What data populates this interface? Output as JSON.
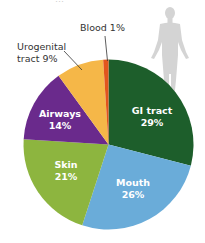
{
  "chart_data": {
    "type": "pie",
    "title": "",
    "categories": [
      "GI tract",
      "Mouth",
      "Skin",
      "Airways",
      "Urogenital tract",
      "Blood"
    ],
    "values": [
      29,
      26,
      21,
      14,
      9,
      1
    ],
    "unit": "%",
    "colors": [
      "#1d5e2b",
      "#6aacd9",
      "#8db53f",
      "#6a2a8c",
      "#f5b748",
      "#e2551d"
    ],
    "start_angle": "top, clockwise",
    "labels": {
      "gi": {
        "name": "GI tract",
        "pct": "29%"
      },
      "mouth": {
        "name": "Mouth",
        "pct": "26%"
      },
      "skin": {
        "name": "Skin",
        "pct": "21%"
      },
      "airways": {
        "name": "Airways",
        "pct": "14%"
      },
      "urogenital": {
        "line1": "Urogenital",
        "line2": "tract 9%"
      },
      "blood": {
        "text": "Blood 1%"
      }
    },
    "legend": "none",
    "decoration": "human-silhouette"
  },
  "top_text_clipped": "…"
}
